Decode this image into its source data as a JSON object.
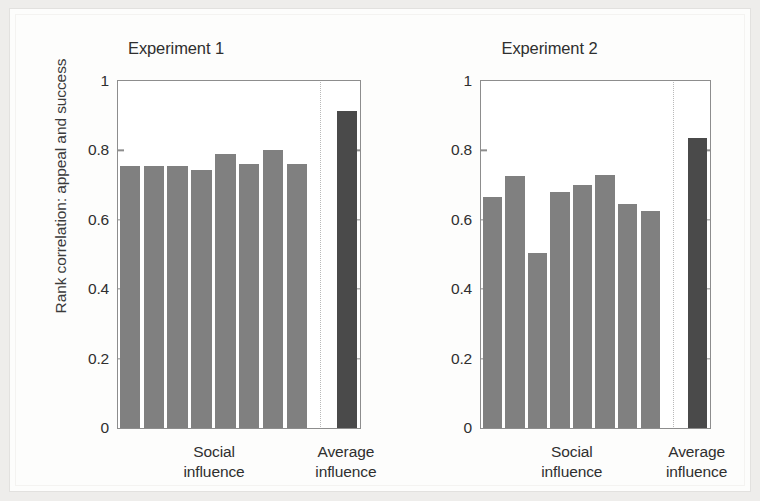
{
  "figure": {
    "y_axis_title": "Rank correlation: appeal and success",
    "bar_color_social": "#808080",
    "bar_color_average": "#4a4a4a",
    "axis_color": "#8d8d8d"
  },
  "chart_data": [
    {
      "type": "bar",
      "title": "Experiment 1",
      "xlabel": "",
      "ylabel": "Rank correlation: appeal and success",
      "ylim": [
        0,
        1
      ],
      "yticks": [
        0,
        0.2,
        0.4,
        0.6,
        0.8,
        1
      ],
      "ytick_labels": [
        "0",
        "0.2",
        "0.4",
        "0.6",
        "0.8",
        "1"
      ],
      "grid": false,
      "legend": "none",
      "group_labels": [
        "Social influence",
        "Average influence"
      ],
      "categories": [
        "World 1",
        "World 2",
        "World 3",
        "World 4",
        "World 5",
        "World 6",
        "World 7",
        "World 8",
        "Average"
      ],
      "series": [
        {
          "name": "Social influence",
          "color": "#808080",
          "values": [
            0.755,
            0.755,
            0.755,
            0.745,
            0.79,
            0.76,
            0.8,
            0.76
          ]
        },
        {
          "name": "Average influence",
          "color": "#4a4a4a",
          "values": [
            0.915
          ]
        }
      ]
    },
    {
      "type": "bar",
      "title": "Experiment 2",
      "xlabel": "",
      "ylabel": "Rank correlation: appeal and success",
      "ylim": [
        0,
        1
      ],
      "yticks": [
        0,
        0.2,
        0.4,
        0.6,
        0.8,
        1
      ],
      "ytick_labels": [
        "0",
        "0.2",
        "0.4",
        "0.6",
        "0.8",
        "1"
      ],
      "grid": false,
      "legend": "none",
      "group_labels": [
        "Social influence",
        "Average influence"
      ],
      "categories": [
        "World 1",
        "World 2",
        "World 3",
        "World 4",
        "World 5",
        "World 6",
        "World 7",
        "World 8",
        "Average"
      ],
      "series": [
        {
          "name": "Social influence",
          "color": "#808080",
          "values": [
            0.665,
            0.725,
            0.505,
            0.68,
            0.7,
            0.73,
            0.645,
            0.625
          ]
        },
        {
          "name": "Average influence",
          "color": "#4a4a4a",
          "values": [
            0.835
          ]
        }
      ]
    }
  ]
}
